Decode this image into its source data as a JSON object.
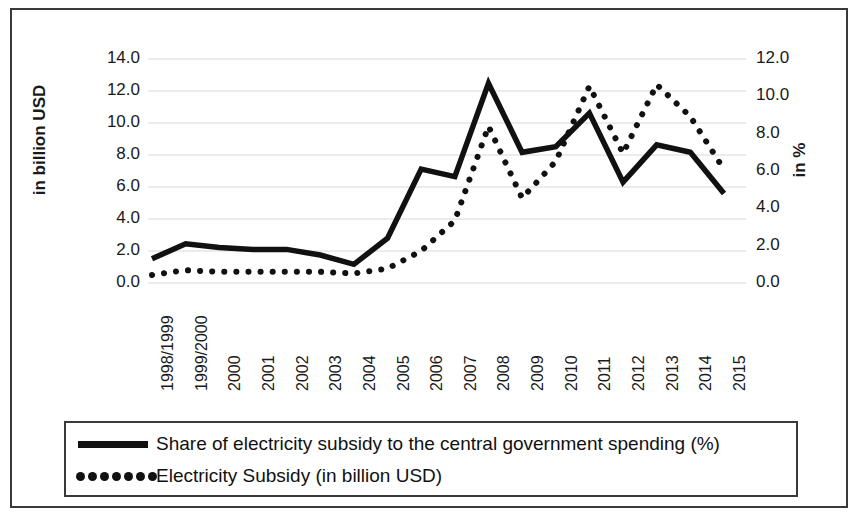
{
  "chart_data": {
    "type": "line",
    "title": "",
    "subtitle": "",
    "xlabel": "",
    "ylabel": "in billion USD",
    "y2label": "in %",
    "ylim": [
      0.0,
      14.0
    ],
    "y2lim": [
      0.0,
      12.0
    ],
    "yticks": [
      "0.0",
      "2.0",
      "4.0",
      "6.0",
      "8.0",
      "10.0",
      "12.0",
      "14.0"
    ],
    "y2ticks": [
      "0.0",
      "2.0",
      "4.0",
      "6.0",
      "8.0",
      "10.0",
      "12.0"
    ],
    "grid": true,
    "legend_position": "bottom",
    "categories": [
      "1998/1999",
      "1999/2000",
      "2000",
      "2001",
      "2002",
      "2003",
      "2004",
      "2005",
      "2006",
      "2007",
      "2008",
      "2009",
      "2010",
      "2011",
      "2012",
      "2013",
      "2014",
      "2015"
    ],
    "series": [
      {
        "name": "Share of electricity subsidy to the central government spending (%)",
        "style": "solid",
        "axis": "right",
        "unit": "%",
        "values": [
          1.3,
          2.1,
          1.9,
          1.8,
          1.8,
          1.5,
          1.0,
          2.4,
          6.1,
          5.7,
          10.7,
          7.0,
          7.3,
          9.1,
          5.4,
          7.4,
          7.0,
          4.8
        ]
      },
      {
        "name": "Electricity Subsidy (in billion USD)",
        "style": "dotted",
        "axis": "left",
        "unit": "billion USD",
        "values": [
          0.5,
          0.8,
          0.7,
          0.7,
          0.7,
          0.7,
          0.6,
          0.9,
          2.0,
          3.9,
          9.8,
          5.3,
          7.6,
          12.3,
          8.1,
          12.4,
          10.4,
          7.1
        ]
      }
    ]
  },
  "axes": {
    "left_title": "in billion USD",
    "right_title": "in %"
  },
  "legend": {
    "items": [
      {
        "label": "Share of electricity subsidy to the central government spending (%)",
        "style": "solid"
      },
      {
        "label": "Electricity Subsidy (in billion USD)",
        "style": "dotted"
      }
    ]
  }
}
